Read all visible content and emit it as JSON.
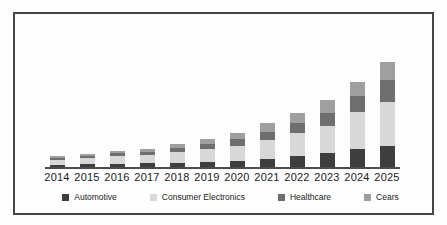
{
  "window": {
    "background": "#fefefe",
    "frame_border_color": "#454545"
  },
  "axis": {
    "line_color": "#4d4d4d",
    "tick_label_color": "#1b1b1b"
  },
  "chart_data": {
    "type": "bar",
    "stacked": true,
    "title": "",
    "xlabel": "",
    "ylabel": "",
    "value_axis_visible": false,
    "grid": false,
    "units": "relative height (no value axis shown in image)",
    "legend_position": "bottom",
    "categories": [
      "2014",
      "2015",
      "2016",
      "2017",
      "2018",
      "2019",
      "2020",
      "2021",
      "2022",
      "2023",
      "2024",
      "2025"
    ],
    "series": [
      {
        "name": "Automotive",
        "color": "#3e3e3e",
        "values": [
          2,
          3,
          3.5,
          4,
          4.5,
          5.5,
          6.5,
          8,
          11,
          14,
          18,
          21
        ]
      },
      {
        "name": "Consumer Electronics",
        "color": "#d8d8d8",
        "values": [
          5,
          6.5,
          8,
          8.5,
          10.5,
          12.5,
          15,
          19,
          23,
          27,
          37,
          44
        ]
      },
      {
        "name": "Healthcare",
        "color": "#6e6e6e",
        "values": [
          2,
          2,
          2.5,
          3,
          4,
          5,
          6.5,
          8.5,
          10,
          13,
          16,
          22
        ]
      },
      {
        "name": "Cears",
        "color": "#9f9f9f",
        "values": [
          2,
          2,
          2.5,
          3,
          4,
          5,
          6,
          8.5,
          10,
          13,
          14,
          18
        ]
      }
    ],
    "totals": [
      11,
      13.5,
      16.5,
      18.5,
      23,
      28,
      34,
      44,
      54,
      67,
      85,
      105
    ]
  }
}
